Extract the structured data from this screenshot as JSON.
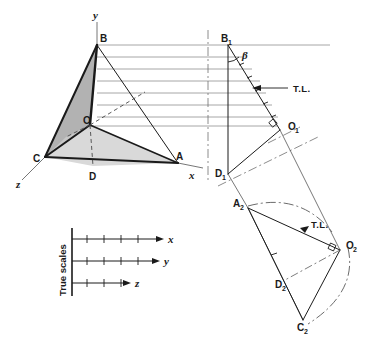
{
  "figure": {
    "background": "#ffffff",
    "ink": "#1a1a1a",
    "thin_line": "#555555",
    "projector_color": "#8a8a8a",
    "fill_upper": "#b2b2b2",
    "fill_base": "#d9d9d9",
    "fill_left": "#c4c4c4"
  },
  "axes": {
    "y_label": "y",
    "x_label": "x",
    "z_label": "z"
  },
  "main_view": {
    "vertices": {
      "B": "B",
      "O": "O",
      "C": "C",
      "D": "D",
      "A": "A"
    }
  },
  "aux_view_1": {
    "vertices": {
      "B1_base": "B",
      "B1_sub": "1",
      "O1_base": "O",
      "O1_sub": "1",
      "D1_base": "D",
      "D1_sub": "1"
    },
    "angle_label": "β",
    "true_length_label": "T.L."
  },
  "aux_view_2": {
    "vertices": {
      "A2_base": "A",
      "A2_sub": "2",
      "O2_base": "O",
      "O2_sub": "2",
      "D2_base": "D",
      "D2_sub": "2",
      "C2_base": "C",
      "C2_sub": "2"
    },
    "true_length_label": "T.L."
  },
  "legend": {
    "title": "True scales",
    "scales": [
      {
        "label": "x",
        "ticks": 5
      },
      {
        "label": "y",
        "ticks": 5
      },
      {
        "label": "z",
        "ticks": 3
      }
    ]
  }
}
